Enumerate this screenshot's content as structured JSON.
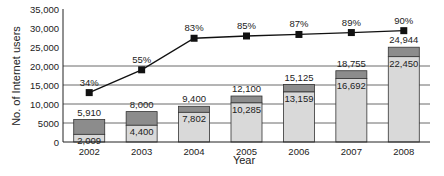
{
  "chart_data": {
    "type": "bar",
    "title": "",
    "xlabel": "Year",
    "ylabel": "No. of Internet users",
    "ylim": [
      0,
      35000
    ],
    "yticks": [
      0,
      5000,
      10000,
      15000,
      20000,
      25000,
      30000,
      35000
    ],
    "ytick_labels": [
      "0",
      "5000",
      "10,000",
      "15,000",
      "20,000",
      "25,000",
      "30,000",
      "35,000"
    ],
    "grid": "horizontal at 5000, 10000, 15000, 20000",
    "categories": [
      "2002",
      "2003",
      "2004",
      "2005",
      "2006",
      "2007",
      "2008"
    ],
    "series": [
      {
        "name": "Internet users (lower segment)",
        "values": [
          2009,
          4400,
          7802,
          10285,
          13159,
          16692,
          22450
        ],
        "labels": [
          "2,009",
          "4,400",
          "7,802",
          "10,285",
          "13,159",
          "16,692",
          "22,450"
        ],
        "color": "#d9d9d9"
      },
      {
        "name": "Total",
        "values": [
          5910,
          8000,
          9400,
          12100,
          15125,
          18755,
          24944
        ],
        "labels": [
          "5,910",
          "8,000",
          "9,400",
          "12,100",
          "15,125",
          "18,755",
          "24,944"
        ],
        "color": "#8c8c8c"
      },
      {
        "name": "Percentage",
        "type": "line",
        "values": [
          34,
          55,
          83,
          85,
          87,
          89,
          90
        ],
        "labels": [
          "34%",
          "55%",
          "83%",
          "85%",
          "87%",
          "89%",
          "90%"
        ],
        "plotted_at": [
          13000,
          19000,
          27300,
          27900,
          28300,
          28800,
          29300
        ],
        "color": "#111111"
      }
    ]
  }
}
